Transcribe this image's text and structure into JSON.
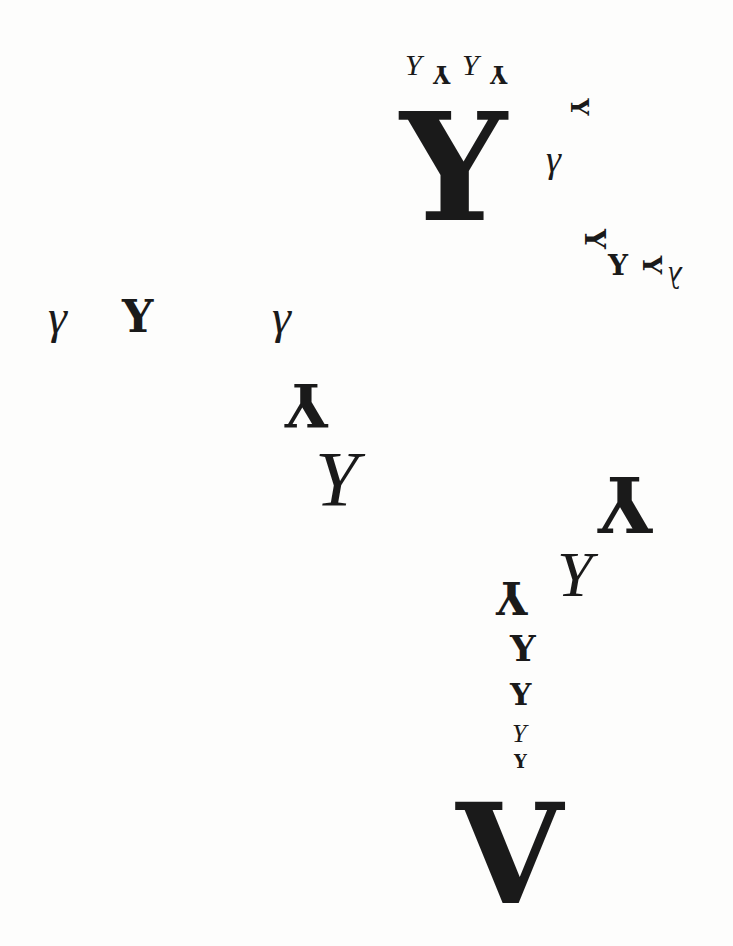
{
  "composition": {
    "background": "#fdfdfc",
    "ink": "#1a1a1a",
    "glyphs": [
      {
        "id": "top-italic-1",
        "char": "Y",
        "x": 405,
        "y": 50,
        "size": 30,
        "style": "italic",
        "rotate": 0
      },
      {
        "id": "top-inverted-1",
        "char": "Y",
        "x": 433,
        "y": 62,
        "size": 24,
        "style": "bold",
        "rotate": 180
      },
      {
        "id": "top-italic-2",
        "char": "Y",
        "x": 462,
        "y": 50,
        "size": 30,
        "style": "italic",
        "rotate": 0
      },
      {
        "id": "top-inverted-2",
        "char": "Y",
        "x": 490,
        "y": 62,
        "size": 24,
        "style": "bold",
        "rotate": 180
      },
      {
        "id": "big-y",
        "char": "Y",
        "x": 400,
        "y": 92,
        "size": 150,
        "style": "bold",
        "rotate": 0
      },
      {
        "id": "small-sideways-y",
        "char": "Y",
        "x": 570,
        "y": 95,
        "size": 24,
        "style": "bold",
        "rotate": 90
      },
      {
        "id": "gamma-top",
        "char": "γ",
        "x": 546,
        "y": 140,
        "size": 38,
        "style": "italic",
        "rotate": 0
      },
      {
        "id": "sideways-y-2",
        "char": "Y",
        "x": 584,
        "y": 225,
        "size": 28,
        "style": "bold",
        "rotate": 90
      },
      {
        "id": "upright-small-y",
        "char": "Y",
        "x": 608,
        "y": 252,
        "size": 28,
        "style": "bold",
        "rotate": 0
      },
      {
        "id": "sideways-y-3",
        "char": "Y",
        "x": 643,
        "y": 252,
        "size": 26,
        "style": "bold",
        "rotate": 90
      },
      {
        "id": "lambda-right",
        "char": "λ",
        "x": 668,
        "y": 262,
        "size": 32,
        "style": "italic",
        "rotate": 180
      },
      {
        "id": "gamma-left",
        "char": "γ",
        "x": 48,
        "y": 293,
        "size": 48,
        "style": "italic",
        "rotate": 0
      },
      {
        "id": "y-left",
        "char": "Y",
        "x": 122,
        "y": 295,
        "size": 44,
        "style": "bold",
        "rotate": 0
      },
      {
        "id": "gamma-mid",
        "char": "γ",
        "x": 272,
        "y": 293,
        "size": 48,
        "style": "italic",
        "rotate": 0
      },
      {
        "id": "inverted-y-mid",
        "char": "Y",
        "x": 285,
        "y": 375,
        "size": 60,
        "style": "bold",
        "rotate": 180
      },
      {
        "id": "italic-y-mid",
        "char": "Y",
        "x": 315,
        "y": 440,
        "size": 78,
        "style": "italic",
        "rotate": 0
      },
      {
        "id": "inverted-y-right",
        "char": "Y",
        "x": 598,
        "y": 465,
        "size": 76,
        "style": "bold",
        "rotate": 180
      },
      {
        "id": "italic-y-right",
        "char": "Y",
        "x": 557,
        "y": 543,
        "size": 64,
        "style": "italic",
        "rotate": 0
      },
      {
        "id": "inverted-y-small",
        "char": "Y",
        "x": 496,
        "y": 575,
        "size": 44,
        "style": "bold",
        "rotate": 180
      },
      {
        "id": "y-stack-1",
        "char": "Y",
        "x": 510,
        "y": 630,
        "size": 36,
        "style": "bold",
        "rotate": 0
      },
      {
        "id": "y-stack-2",
        "char": "Y",
        "x": 510,
        "y": 680,
        "size": 30,
        "style": "bold",
        "rotate": 0
      },
      {
        "id": "y-stack-3",
        "char": "Y",
        "x": 512,
        "y": 721,
        "size": 26,
        "style": "italic",
        "rotate": 0
      },
      {
        "id": "y-stack-4",
        "char": "Y",
        "x": 514,
        "y": 753,
        "size": 18,
        "style": "bold",
        "rotate": 0
      },
      {
        "id": "big-v",
        "char": "V",
        "x": 456,
        "y": 786,
        "size": 138,
        "style": "bold",
        "rotate": 0
      }
    ]
  }
}
